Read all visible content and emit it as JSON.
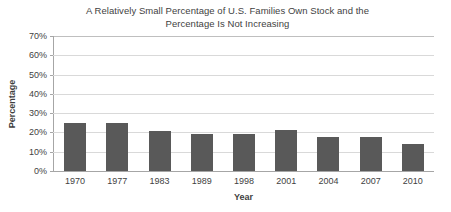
{
  "chart_data": {
    "type": "bar",
    "title": "A Relatively Small Percentage of U.S. Families Own Stock and the Percentage Is Not Increasing",
    "title_lines": [
      "A Relatively Small Percentage of U.S. Families Own Stock and the",
      "Percentage Is Not Increasing"
    ],
    "xlabel": "Year",
    "ylabel": "Percentage",
    "categories": [
      "1970",
      "1977",
      "1983",
      "1989",
      "1998",
      "2001",
      "2004",
      "2007",
      "2010"
    ],
    "values": [
      25,
      25,
      20.5,
      19,
      19,
      21.5,
      17.5,
      17.5,
      14
    ],
    "ylim": [
      0,
      70
    ],
    "ytick_values": [
      70,
      60,
      50,
      40,
      30,
      20,
      10,
      0
    ],
    "ytick_labels": [
      "70%",
      "60%",
      "50%",
      "40%",
      "30%",
      "20%",
      "10%",
      "0%"
    ],
    "grid": true,
    "legend": null,
    "legend_position": "none",
    "series": [
      {
        "name": "Percentage of U.S. families owning stock",
        "values": [
          25,
          25,
          20.5,
          19,
          19,
          21.5,
          17.5,
          17.5,
          14
        ]
      }
    ],
    "colors": {
      "bar": "#595959",
      "gridline": "#d9d9d9",
      "axis": "#a6a6a6",
      "plot_border": "#bfbfbf",
      "text": "#3f3f3f",
      "background": "#ffffff"
    }
  }
}
